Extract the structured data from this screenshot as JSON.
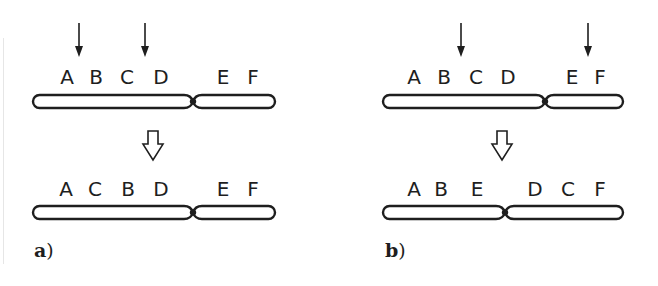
{
  "panels": [
    {
      "id": "a",
      "label_letter": "a",
      "label_paren": ")",
      "label_pos": {
        "x": 34,
        "y": 257
      },
      "before": {
        "genes": [
          {
            "label": "A",
            "x": 67
          },
          {
            "label": "B",
            "x": 96
          },
          {
            "label": "C",
            "x": 127
          },
          {
            "label": "D",
            "x": 161
          },
          {
            "label": "E",
            "x": 223
          },
          {
            "label": "F",
            "x": 253
          }
        ],
        "baseline_y": 84,
        "chromosome": {
          "x1": 33,
          "x2": 275,
          "y_top": 95,
          "y_bottom": 108,
          "centromere_x": 193
        }
      },
      "break_arrows": [
        {
          "x": 79,
          "y1": 23,
          "y2": 57
        },
        {
          "x": 145,
          "y1": 23,
          "y2": 57
        }
      ],
      "transition_arrow": {
        "cx": 153,
        "y_top": 131,
        "y_bottom": 160
      },
      "after": {
        "genes": [
          {
            "label": "A",
            "x": 66
          },
          {
            "label": "C",
            "x": 95
          },
          {
            "label": "B",
            "x": 128
          },
          {
            "label": "D",
            "x": 161
          },
          {
            "label": "E",
            "x": 223
          },
          {
            "label": "F",
            "x": 253
          }
        ],
        "baseline_y": 196,
        "chromosome": {
          "x1": 33,
          "x2": 275,
          "y_top": 206,
          "y_bottom": 219,
          "centromere_x": 193
        }
      }
    },
    {
      "id": "b",
      "label_letter": "b",
      "label_paren": ")",
      "label_pos": {
        "x": 385,
        "y": 257
      },
      "before": {
        "genes": [
          {
            "label": "A",
            "x": 414
          },
          {
            "label": "B",
            "x": 444
          },
          {
            "label": "C",
            "x": 476
          },
          {
            "label": "D",
            "x": 508
          },
          {
            "label": "E",
            "x": 572
          },
          {
            "label": "F",
            "x": 600
          }
        ],
        "baseline_y": 84,
        "chromosome": {
          "x1": 383,
          "x2": 623,
          "y_top": 95,
          "y_bottom": 108,
          "centromere_x": 545
        }
      },
      "break_arrows": [
        {
          "x": 461,
          "y1": 23,
          "y2": 57
        },
        {
          "x": 588,
          "y1": 23,
          "y2": 57
        }
      ],
      "transition_arrow": {
        "cx": 502,
        "y_top": 131,
        "y_bottom": 160
      },
      "after": {
        "genes": [
          {
            "label": "A",
            "x": 414
          },
          {
            "label": "B",
            "x": 441
          },
          {
            "label": "E",
            "x": 477
          },
          {
            "label": "D",
            "x": 535
          },
          {
            "label": "C",
            "x": 568
          },
          {
            "label": "F",
            "x": 600
          }
        ],
        "baseline_y": 196,
        "chromosome": {
          "x1": 383,
          "x2": 623,
          "y_top": 206,
          "y_bottom": 219,
          "centromere_x": 505
        }
      }
    }
  ],
  "colors": {
    "ink": "#1e1e1e",
    "background": "#ffffff",
    "edge_line": "#e6e6e6"
  }
}
